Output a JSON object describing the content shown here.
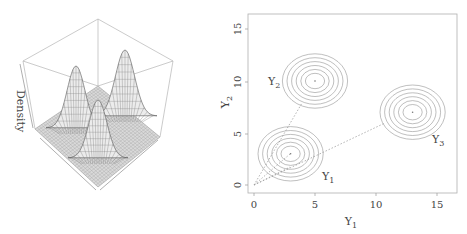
{
  "chart_data": [
    {
      "type": "surface3d",
      "title": "",
      "zlabel": "Density",
      "description": "Perspective wireframe surface of a bivariate density with three Gaussian peaks",
      "peaks": [
        {
          "name": "Y1",
          "relative_height": 0.85
        },
        {
          "name": "Y2",
          "relative_height": 0.85
        },
        {
          "name": "Y3",
          "relative_height": 1.0
        }
      ]
    },
    {
      "type": "contour",
      "title": "",
      "xlabel": "Y1",
      "ylabel": "Y2",
      "xlim": [
        0,
        16.5
      ],
      "ylim": [
        -0.5,
        16.5
      ],
      "xticks": [
        0,
        5,
        10,
        15
      ],
      "yticks": [
        0,
        5,
        10,
        15
      ],
      "grid": false,
      "centers": [
        {
          "label": "Y1",
          "x": 3,
          "y": 3
        },
        {
          "label": "Y2",
          "x": 5,
          "y": 10
        },
        {
          "label": "Y3",
          "x": 13,
          "y": 7
        }
      ],
      "contour_rings_per_center": 6,
      "dotted_lines": [
        {
          "from": [
            0,
            0
          ],
          "to": [
            3,
            3
          ]
        },
        {
          "from": [
            0,
            0
          ],
          "to": [
            5,
            10
          ]
        },
        {
          "from": [
            0,
            0
          ],
          "to": [
            13,
            7
          ]
        }
      ]
    }
  ],
  "labels": {
    "density": "Density",
    "xlabel_main": "Y",
    "xlabel_sub": "1",
    "ylabel_main": "Y",
    "ylabel_sub": "2",
    "peak_y1_main": "Y",
    "peak_y1_sub": "1",
    "peak_y2_main": "Y",
    "peak_y2_sub": "2",
    "peak_y3_main": "Y",
    "peak_y3_sub": "3",
    "xtick_0": "0",
    "xtick_5": "5",
    "xtick_10": "10",
    "xtick_15": "15",
    "ytick_0": "0",
    "ytick_5": "5",
    "ytick_10": "10",
    "ytick_15": "15"
  },
  "colors": {
    "axis": "#9a9a9a",
    "contour": "#8a8a8a",
    "surface": "#6e6e6e",
    "text": "#444444"
  }
}
